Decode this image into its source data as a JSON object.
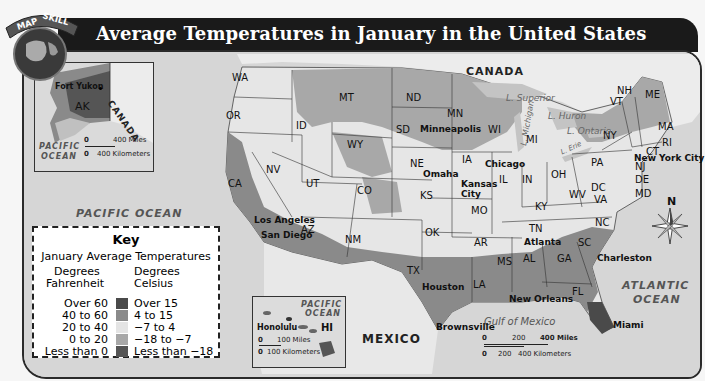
{
  "header": {
    "badge_label": "MAP SKILL",
    "title": "Average Temperatures in January in the United States"
  },
  "key": {
    "title": "Key",
    "subtitle": "January Average Temperatures",
    "fahrenheit_header_1": "Degrees",
    "fahrenheit_header_2": "Fahrenheit",
    "celsius_header_1": "Degrees",
    "celsius_header_2": "Celsius",
    "rows": [
      {
        "fahrenheit": "Over 60",
        "celsius": "Over 15",
        "color": "#4a4a4a"
      },
      {
        "fahrenheit": "40 to 60",
        "celsius": "4 to 15",
        "color": "#8a8a8a"
      },
      {
        "fahrenheit": "20 to 40",
        "celsius": "−7 to 4",
        "color": "#e4e4e4"
      },
      {
        "fahrenheit": "0 to 20",
        "celsius": "−18 to −7",
        "color": "#a8a8a8"
      },
      {
        "fahrenheit": "Less than 0",
        "celsius": "Less than −18",
        "color": "#555555"
      }
    ]
  },
  "alaska_inset": {
    "state": "AK",
    "city": "Fort Yukon",
    "country": "CANADA",
    "ocean_1": "PACIFIC",
    "ocean_2": "OCEAN",
    "scale_miles": "400 Miles",
    "scale_km": "400 Kilometers",
    "scale_zero": "0"
  },
  "hawaii_inset": {
    "state": "HI",
    "city": "Honolulu",
    "ocean_1": "PACIFIC",
    "ocean_2": "OCEAN",
    "scale_miles": "100 Miles",
    "scale_km": "100 Kilometers",
    "scale_zero": "0"
  },
  "main_scale": {
    "zero": "0",
    "mid": "200",
    "miles": "400 Miles",
    "km_mid": "200",
    "km": "400 Kilometers"
  },
  "water_bodies": {
    "pacific": "PACIFIC OCEAN",
    "atlantic_1": "ATLANTIC",
    "atlantic_2": "OCEAN",
    "gulf": "Gulf of Mexico",
    "superior": "L. Superior",
    "michigan": "L. Michigan",
    "huron": "L. Huron",
    "ontario": "L. Ontario",
    "erie": "L. Erie"
  },
  "countries": {
    "canada": "CANADA",
    "mexico": "MEXICO"
  },
  "compass": {
    "north": "N"
  },
  "states": [
    {
      "abbr": "WA",
      "x": 238,
      "y": 78
    },
    {
      "abbr": "OR",
      "x": 232,
      "y": 116
    },
    {
      "abbr": "CA",
      "x": 234,
      "y": 184
    },
    {
      "abbr": "NV",
      "x": 272,
      "y": 170
    },
    {
      "abbr": "ID",
      "x": 302,
      "y": 126
    },
    {
      "abbr": "MT",
      "x": 345,
      "y": 98
    },
    {
      "abbr": "WY",
      "x": 353,
      "y": 145
    },
    {
      "abbr": "UT",
      "x": 312,
      "y": 184
    },
    {
      "abbr": "CO",
      "x": 363,
      "y": 191
    },
    {
      "abbr": "AZ",
      "x": 307,
      "y": 230
    },
    {
      "abbr": "NM",
      "x": 351,
      "y": 240
    },
    {
      "abbr": "ND",
      "x": 412,
      "y": 98
    },
    {
      "abbr": "SD",
      "x": 402,
      "y": 130
    },
    {
      "abbr": "NE",
      "x": 416,
      "y": 164
    },
    {
      "abbr": "KS",
      "x": 426,
      "y": 196
    },
    {
      "abbr": "OK",
      "x": 431,
      "y": 233
    },
    {
      "abbr": "TX",
      "x": 413,
      "y": 271
    },
    {
      "abbr": "MN",
      "x": 453,
      "y": 114
    },
    {
      "abbr": "IA",
      "x": 468,
      "y": 160
    },
    {
      "abbr": "MO",
      "x": 477,
      "y": 211
    },
    {
      "abbr": "AR",
      "x": 480,
      "y": 243
    },
    {
      "abbr": "LA",
      "x": 479,
      "y": 285
    },
    {
      "abbr": "WI",
      "x": 494,
      "y": 130
    },
    {
      "abbr": "IL",
      "x": 505,
      "y": 180
    },
    {
      "abbr": "MI",
      "x": 532,
      "y": 140
    },
    {
      "abbr": "IN",
      "x": 528,
      "y": 180
    },
    {
      "abbr": "OH",
      "x": 557,
      "y": 175
    },
    {
      "abbr": "KY",
      "x": 541,
      "y": 207
    },
    {
      "abbr": "TN",
      "x": 535,
      "y": 229
    },
    {
      "abbr": "MS",
      "x": 503,
      "y": 262
    },
    {
      "abbr": "AL",
      "x": 529,
      "y": 259
    },
    {
      "abbr": "GA",
      "x": 563,
      "y": 259
    },
    {
      "abbr": "FL",
      "x": 578,
      "y": 292
    },
    {
      "abbr": "SC",
      "x": 584,
      "y": 243
    },
    {
      "abbr": "NC",
      "x": 601,
      "y": 223
    },
    {
      "abbr": "VA",
      "x": 600,
      "y": 200
    },
    {
      "abbr": "WV",
      "x": 575,
      "y": 195
    },
    {
      "abbr": "DC",
      "x": 597,
      "y": 188
    },
    {
      "abbr": "MD",
      "x": 641,
      "y": 194
    },
    {
      "abbr": "DE",
      "x": 641,
      "y": 180
    },
    {
      "abbr": "NJ",
      "x": 641,
      "y": 167
    },
    {
      "abbr": "PA",
      "x": 597,
      "y": 163
    },
    {
      "abbr": "NY",
      "x": 609,
      "y": 136
    },
    {
      "abbr": "CT",
      "x": 652,
      "y": 152
    },
    {
      "abbr": "RI",
      "x": 668,
      "y": 143
    },
    {
      "abbr": "MA",
      "x": 664,
      "y": 127
    },
    {
      "abbr": "VT",
      "x": 616,
      "y": 102
    },
    {
      "abbr": "NH",
      "x": 623,
      "y": 91
    },
    {
      "abbr": "ME",
      "x": 651,
      "y": 95
    }
  ],
  "cities": [
    {
      "name": "Minneapolis",
      "x": 420,
      "y": 130
    },
    {
      "name": "Omaha",
      "x": 423,
      "y": 175
    },
    {
      "name": "Kansas",
      "x": 461,
      "y": 185
    },
    {
      "name": "City",
      "x": 461,
      "y": 195
    },
    {
      "name": "Chicago",
      "x": 485,
      "y": 165
    },
    {
      "name": "Los Angeles",
      "x": 254,
      "y": 221
    },
    {
      "name": "San Diego",
      "x": 261,
      "y": 236
    },
    {
      "name": "Houston",
      "x": 422,
      "y": 288
    },
    {
      "name": "Brownsville",
      "x": 436,
      "y": 328
    },
    {
      "name": "New Orleans",
      "x": 509,
      "y": 300
    },
    {
      "name": "Atlanta",
      "x": 524,
      "y": 243
    },
    {
      "name": "Charleston",
      "x": 597,
      "y": 259
    },
    {
      "name": "Miami",
      "x": 613,
      "y": 326
    },
    {
      "name": "New York City",
      "x": 634,
      "y": 159
    }
  ]
}
